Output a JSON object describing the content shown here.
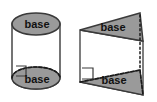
{
  "figure": {
    "background_color": "#ffffff",
    "fill_color": "#9a9a9a",
    "stroke_color": "#3a3a3a",
    "label_color": "#111111",
    "shapes": [
      {
        "name": "cylinder",
        "type": "cylinder",
        "top_base_label": "base",
        "bottom_base_label": "base",
        "has_right_angle_marker": true,
        "hidden_edges_dashed": true
      },
      {
        "name": "triangular-prism",
        "type": "oblique triangular prism",
        "top_base_label": "base",
        "bottom_base_label": "base",
        "has_right_angle_marker": true,
        "hidden_edges_dashed": true,
        "axis_dotted": true
      }
    ],
    "labels": {
      "cylinder_top": "base",
      "cylinder_bottom": "base",
      "prism_top": "base",
      "prism_bottom": "base"
    }
  }
}
